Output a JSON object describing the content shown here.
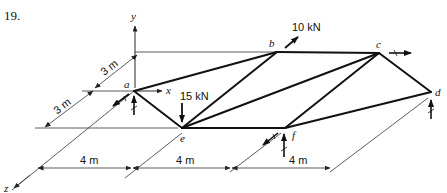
{
  "problem_number": "19.",
  "axes": {
    "x": "x",
    "y": "y",
    "z": "z"
  },
  "nodes": {
    "a": "a",
    "b": "b",
    "c": "c",
    "d": "d",
    "e": "e",
    "f": "f"
  },
  "loads": {
    "b": "10 kN",
    "e": "15 kN"
  },
  "dimensions": {
    "depth_upper": "3 m",
    "depth_lower": "3 m",
    "span_1": "4 m",
    "span_2": "4 m",
    "span_3": "4 m"
  },
  "members": [
    [
      "a",
      "b"
    ],
    [
      "b",
      "c"
    ],
    [
      "c",
      "d"
    ],
    [
      "a",
      "e"
    ],
    [
      "e",
      "f"
    ],
    [
      "f",
      "d"
    ],
    [
      "e",
      "b"
    ],
    [
      "e",
      "c"
    ],
    [
      "f",
      "c"
    ]
  ]
}
